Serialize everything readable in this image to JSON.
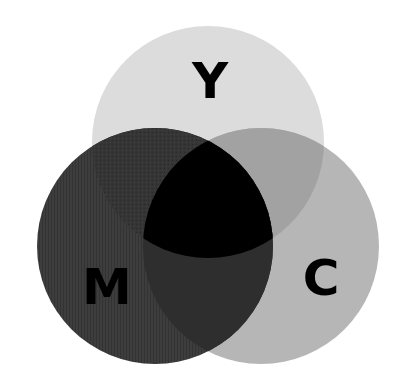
{
  "diagram": {
    "type": "venn",
    "sets": [
      {
        "id": "Y",
        "label": "Y",
        "cx": 208,
        "cy": 142,
        "r": 116,
        "color": "#dcdcdc"
      },
      {
        "id": "M",
        "label": "M",
        "cx": 155,
        "cy": 246,
        "r": 118,
        "color": "#3c3c3c"
      },
      {
        "id": "C",
        "label": "C",
        "cx": 261,
        "cy": 246,
        "r": 118,
        "color": "#b6b6b6"
      }
    ],
    "intersections": {
      "M_Y": "#333333",
      "C_Y": "#a2a2a2",
      "M_C": "#2e2e2e",
      "M_C_Y": "#000000"
    },
    "labels": {
      "y": "Y",
      "m": "M",
      "c": "C"
    }
  }
}
